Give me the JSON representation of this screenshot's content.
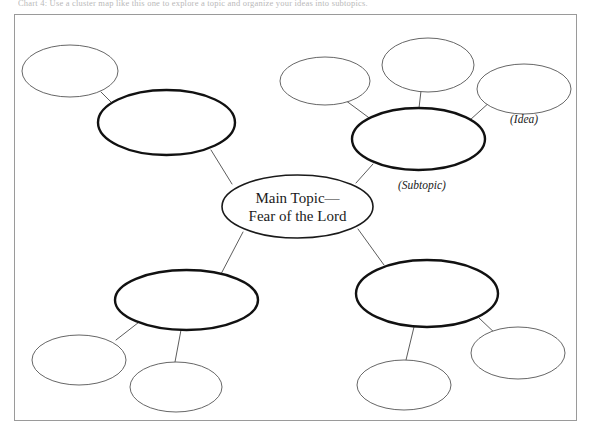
{
  "page": {
    "top_cut_text": "Chart 4:    Use a cluster map like this one to explore a topic and organize your ideas into subtopics.",
    "frame_color": "#9a9a9a",
    "background_color": "#ffffff",
    "ink_color": "#1a1a1a"
  },
  "chart_data": {
    "type": "diagram",
    "diagram_kind": "cluster-map",
    "stroke_colors": {
      "center": "#1a1a1a",
      "subtopic": "#111111",
      "idea": "#555555",
      "connector": "#4a4a4a"
    },
    "stroke_widths": {
      "center": 1.6,
      "subtopic": 2.4,
      "idea": 0.9,
      "connector": 0.9
    },
    "nodes": [
      {
        "id": "center",
        "role": "main-topic",
        "label_line_1": "Main Topic—",
        "label_line_2": "Fear of the Lord",
        "cx": 297.5,
        "cy": 206.5,
        "rx": 75.5,
        "ry": 31.5,
        "filled": false
      },
      {
        "id": "subtopic-upper-left",
        "role": "subtopic",
        "label_line_1": "",
        "label_line_2": "",
        "cx": 166.5,
        "cy": 122.5,
        "rx": 68.5,
        "ry": 32.5,
        "filled": false
      },
      {
        "id": "subtopic-upper-right",
        "role": "subtopic",
        "label_line_1": "",
        "label_line_2": "",
        "cx": 418.5,
        "cy": 139.0,
        "rx": 66.5,
        "ry": 31.0,
        "filled": false
      },
      {
        "id": "subtopic-lower-left",
        "role": "subtopic",
        "label_line_1": "",
        "label_line_2": "",
        "cx": 186.5,
        "cy": 300.0,
        "rx": 71.5,
        "ry": 30.0,
        "filled": false
      },
      {
        "id": "subtopic-lower-right",
        "role": "subtopic",
        "label_line_1": "",
        "label_line_2": "",
        "cx": 427.0,
        "cy": 293.5,
        "rx": 71.0,
        "ry": 33.5,
        "filled": false
      },
      {
        "id": "idea-ul-1",
        "role": "idea",
        "label_line_1": "",
        "label_line_2": "",
        "cx": 70.0,
        "cy": 71.0,
        "rx": 48.0,
        "ry": 26.0,
        "filled": false
      },
      {
        "id": "idea-ur-1",
        "role": "idea",
        "label_line_1": "",
        "label_line_2": "",
        "cx": 325.0,
        "cy": 81.0,
        "rx": 45.0,
        "ry": 24.0,
        "filled": false
      },
      {
        "id": "idea-ur-2",
        "role": "idea",
        "label_line_1": "",
        "label_line_2": "",
        "cx": 428.0,
        "cy": 65.0,
        "rx": 46.0,
        "ry": 27.0,
        "filled": false
      },
      {
        "id": "idea-ur-3",
        "role": "idea",
        "label_line_1": "",
        "label_line_2": "",
        "cx": 524.0,
        "cy": 89.0,
        "rx": 47.0,
        "ry": 25.0,
        "filled": false
      },
      {
        "id": "idea-ll-1",
        "role": "idea",
        "label_line_1": "",
        "label_line_2": "",
        "cx": 79.0,
        "cy": 360.0,
        "rx": 47.0,
        "ry": 25.0,
        "filled": false
      },
      {
        "id": "idea-ll-2",
        "role": "idea",
        "label_line_1": "",
        "label_line_2": "",
        "cx": 176.0,
        "cy": 387.0,
        "rx": 46.0,
        "ry": 25.0,
        "filled": false
      },
      {
        "id": "idea-lr-1",
        "role": "idea",
        "label_line_1": "",
        "label_line_2": "",
        "cx": 404.0,
        "cy": 385.0,
        "rx": 47.0,
        "ry": 25.0,
        "filled": false
      },
      {
        "id": "idea-lr-2",
        "role": "idea",
        "label_line_1": "",
        "label_line_2": "",
        "cx": 518.0,
        "cy": 353.0,
        "rx": 47.0,
        "ry": 26.0,
        "filled": false
      }
    ],
    "edges": [
      {
        "from": "center",
        "to": "subtopic-upper-left",
        "x1": 232,
        "y1": 184,
        "x2": 211,
        "y2": 150
      },
      {
        "from": "center",
        "to": "subtopic-upper-right",
        "x1": 356,
        "y1": 183,
        "x2": 373,
        "y2": 164
      },
      {
        "from": "center",
        "to": "subtopic-lower-left",
        "x1": 243,
        "y1": 232,
        "x2": 221,
        "y2": 274
      },
      {
        "from": "center",
        "to": "subtopic-lower-right",
        "x1": 358,
        "y1": 229,
        "x2": 384,
        "y2": 265
      },
      {
        "from": "subtopic-upper-left",
        "to": "idea-ul-1",
        "x1": 112,
        "y1": 103,
        "x2": 101,
        "y2": 92
      },
      {
        "from": "subtopic-upper-right",
        "to": "idea-ur-1",
        "x1": 372,
        "y1": 120,
        "x2": 345,
        "y2": 100
      },
      {
        "from": "subtopic-upper-right",
        "to": "idea-ur-2",
        "x1": 419,
        "y1": 108,
        "x2": 421,
        "y2": 91
      },
      {
        "from": "subtopic-upper-right",
        "to": "idea-ur-3",
        "x1": 470,
        "y1": 120,
        "x2": 491,
        "y2": 101
      },
      {
        "from": "subtopic-lower-left",
        "to": "idea-ll-1",
        "x1": 143,
        "y1": 319,
        "x2": 116,
        "y2": 340
      },
      {
        "from": "subtopic-lower-left",
        "to": "idea-ll-2",
        "x1": 181,
        "y1": 330,
        "x2": 175,
        "y2": 362
      },
      {
        "from": "subtopic-lower-right",
        "to": "idea-lr-1",
        "x1": 414,
        "y1": 327,
        "x2": 406,
        "y2": 360
      },
      {
        "from": "subtopic-lower-right",
        "to": "idea-lr-2",
        "x1": 479,
        "y1": 318,
        "x2": 498,
        "y2": 336
      }
    ],
    "captions": [
      {
        "id": "caption-subtopic",
        "text": "(Subtopic)",
        "x": 398,
        "y": 179,
        "anchor": "start"
      },
      {
        "id": "caption-idea",
        "text": "(Idea)",
        "x": 510,
        "y": 113,
        "anchor": "start"
      }
    ]
  }
}
